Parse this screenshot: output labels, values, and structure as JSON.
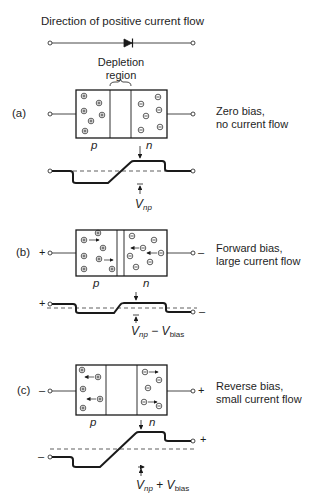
{
  "title": "Direction of positive current flow",
  "depletion_label": [
    "Depletion",
    "region"
  ],
  "panels": [
    {
      "id": "a",
      "label": "(a)",
      "description": [
        "Zero bias,",
        "no current flow"
      ],
      "p_label": "p",
      "n_label": "n",
      "left_terminal_sign": "",
      "right_terminal_sign": "",
      "voltage_label": {
        "main": "V",
        "sub": "np",
        "op": "",
        "main2": "",
        "sub2": ""
      }
    },
    {
      "id": "b",
      "label": "(b)",
      "description": [
        "Forward bias,",
        "large current flow"
      ],
      "p_label": "p",
      "n_label": "n",
      "left_terminal_sign": "+",
      "right_terminal_sign": "–",
      "voltage_label": {
        "main": "V",
        "sub": "np",
        "op": " − ",
        "main2": "V",
        "sub2": "bias"
      }
    },
    {
      "id": "c",
      "label": "(c)",
      "description": [
        "Reverse bias,",
        "small current flow"
      ],
      "p_label": "p",
      "n_label": "n",
      "left_terminal_sign": "–",
      "right_terminal_sign": "+",
      "voltage_label": {
        "main": "V",
        "sub": "np",
        "op": " + ",
        "main2": "V",
        "sub2": "bias"
      }
    }
  ],
  "carriers": {
    "hole": "⊕",
    "electron": "⊖"
  },
  "colors": {
    "line": "#1a1a1a",
    "background": "#ffffff"
  }
}
